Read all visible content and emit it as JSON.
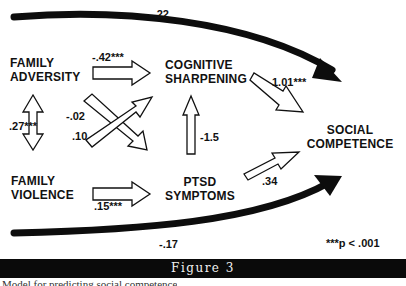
{
  "diagram": {
    "nodes": {
      "family_adversity": [
        "FAMILY",
        "ADVERSITY"
      ],
      "family_violence": [
        "FAMILY",
        "VIOLENCE"
      ],
      "cognitive_sharpening": [
        "COGNITIVE",
        "SHARPENING"
      ],
      "ptsd_symptoms": [
        "PTSD",
        "SYMPTOMS"
      ],
      "social_competence": [
        "SOCIAL",
        "COMPETENCE"
      ]
    },
    "paths": {
      "adversity_to_competence": "-.22",
      "adversity_to_cognitive": "-.42***",
      "adversity_violence_corr": ".27***",
      "adversity_to_ptsd": "-.02",
      "violence_to_cognitive": ".10",
      "ptsd_to_cognitive": "-1.5",
      "cognitive_to_competence": "1.01***",
      "violence_to_ptsd": ".15***",
      "ptsd_to_competence": ".34",
      "violence_to_competence": "-.17"
    },
    "significance_note": "***p < .001"
  },
  "figure": {
    "title": "Figure 3",
    "caption_partial": "Model for predicting social competence"
  },
  "colors": {
    "banner_bg": "#0a0a0a",
    "banner_text": "#f2f2f2",
    "ink": "#111111"
  }
}
